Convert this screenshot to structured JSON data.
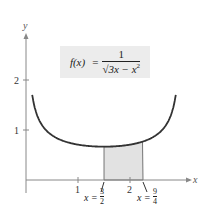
{
  "chart_data": {
    "type": "line",
    "title": "",
    "function": "f(x) = 1 / sqrt(3x - x^2)",
    "formula_label": {
      "lhs": "f(x)",
      "equals": "=",
      "numerator": "1",
      "denominator_radical": "√",
      "denominator_expr": "3x − x",
      "denominator_exponent": "2"
    },
    "xlabel": "x",
    "ylabel": "y",
    "xlim": [
      0,
      3
    ],
    "ylim": [
      0,
      2.8
    ],
    "x_ticks": [
      1,
      2
    ],
    "x_tick_labels": [
      "1",
      "2"
    ],
    "y_ticks": [
      1,
      2
    ],
    "y_tick_labels": [
      "1",
      "2"
    ],
    "grid": false,
    "series": [
      {
        "name": "f(x) = 1/√(3x − x²)",
        "x": [
          0.12,
          0.2,
          0.3,
          0.5,
          0.75,
          1.0,
          1.25,
          1.5,
          1.75,
          2.0,
          2.25,
          2.5,
          2.7,
          2.8,
          2.88
        ],
        "y": [
          1.7,
          1.33,
          1.11,
          0.89,
          0.77,
          0.71,
          0.68,
          0.67,
          0.68,
          0.71,
          0.77,
          0.89,
          1.11,
          1.33,
          1.7
        ]
      }
    ],
    "shaded_region": {
      "x_start": 1.5,
      "x_end": 2.25,
      "fill": "#e2e2e2",
      "description": "region under curve between x = 3/2 and x = 9/4"
    },
    "annotations": [
      {
        "text_var": "x",
        "text_eq": "=",
        "num": "3",
        "den": "2",
        "x_value": 1.5
      },
      {
        "text_var": "x",
        "text_eq": "=",
        "num": "9",
        "den": "4",
        "x_value": 2.25
      }
    ]
  },
  "colors": {
    "curve": "#333333",
    "axis": "#888888",
    "shade": "#e2e2e2",
    "formula_bg": "#ececec"
  }
}
